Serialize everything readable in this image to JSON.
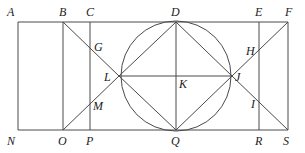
{
  "diagram": {
    "type": "geometric-construction",
    "stroke_color": "#4a4a4a",
    "label_color": "#222222",
    "points": {
      "A": {
        "label": "A",
        "x": 18,
        "y": 22,
        "lx": 7,
        "ly": 16
      },
      "B": {
        "label": "B",
        "x": 63,
        "y": 22,
        "lx": 59,
        "ly": 16
      },
      "C": {
        "label": "C",
        "x": 90,
        "y": 22,
        "lx": 86,
        "ly": 16
      },
      "D": {
        "label": "D",
        "x": 176,
        "y": 22,
        "lx": 171,
        "ly": 16
      },
      "E": {
        "label": "E",
        "x": 259,
        "y": 22,
        "lx": 255,
        "ly": 16
      },
      "F": {
        "label": "F",
        "x": 288,
        "y": 22,
        "lx": 285,
        "ly": 16
      },
      "G": {
        "label": "G",
        "x": 90,
        "y": 46,
        "lx": 94,
        "ly": 51
      },
      "H": {
        "label": "H",
        "x": 259,
        "y": 50,
        "lx": 246,
        "ly": 55
      },
      "L": {
        "label": "L",
        "x": 119,
        "y": 76,
        "lx": 104,
        "ly": 81
      },
      "K": {
        "label": "K",
        "x": 176,
        "y": 76,
        "lx": 179,
        "ly": 88
      },
      "J": {
        "label": "J",
        "x": 232,
        "y": 76,
        "lx": 235,
        "ly": 81
      },
      "M": {
        "label": "M",
        "x": 90,
        "y": 105,
        "lx": 93,
        "ly": 110
      },
      "I": {
        "label": "I",
        "x": 259,
        "y": 103,
        "lx": 251,
        "ly": 108
      },
      "N": {
        "label": "N",
        "x": 18,
        "y": 130,
        "lx": 7,
        "ly": 145
      },
      "O": {
        "label": "O",
        "x": 63,
        "y": 130,
        "lx": 58,
        "ly": 145
      },
      "P": {
        "label": "P",
        "x": 90,
        "y": 130,
        "lx": 86,
        "ly": 145
      },
      "Q": {
        "label": "Q",
        "x": 176,
        "y": 130,
        "lx": 171,
        "ly": 145
      },
      "R": {
        "label": "R",
        "x": 259,
        "y": 130,
        "lx": 255,
        "ly": 145
      },
      "S": {
        "label": "S",
        "x": 288,
        "y": 130,
        "lx": 283,
        "ly": 145
      }
    },
    "circle": {
      "center": "K",
      "cx": 176,
      "cy": 76,
      "r": 55
    },
    "segments": [
      [
        "A",
        "F"
      ],
      [
        "N",
        "S"
      ],
      [
        "A",
        "N"
      ],
      [
        "F",
        "S"
      ],
      [
        "B",
        "O"
      ],
      [
        "C",
        "P"
      ],
      [
        "E",
        "R"
      ],
      [
        "D",
        "Q"
      ],
      [
        "L",
        "J"
      ],
      [
        "B",
        "L"
      ],
      [
        "O",
        "L"
      ],
      [
        "D",
        "L"
      ],
      [
        "D",
        "J"
      ],
      [
        "L",
        "Q"
      ],
      [
        "J",
        "Q"
      ],
      [
        "F",
        "J"
      ],
      [
        "S",
        "J"
      ]
    ]
  }
}
